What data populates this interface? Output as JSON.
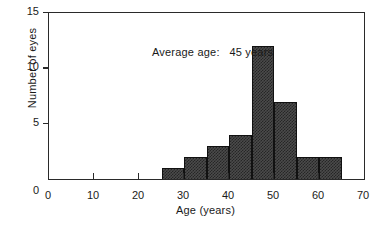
{
  "chart_data": {
    "type": "bar",
    "title": "",
    "subtitle": "",
    "xlabel": "Age (years)",
    "ylabel": "Number of eyes",
    "xlim": [
      0,
      70
    ],
    "ylim": [
      0,
      15
    ],
    "grid": false,
    "legend": null,
    "bin_width": 5,
    "categories": [
      "25-30",
      "30-35",
      "35-40",
      "40-45",
      "45-50",
      "50-55",
      "55-60",
      "60-65"
    ],
    "bin_starts": [
      25,
      30,
      35,
      40,
      45,
      50,
      55,
      60
    ],
    "bin_ends": [
      30,
      35,
      40,
      45,
      50,
      55,
      60,
      65
    ],
    "values": [
      1,
      2,
      3,
      4,
      12,
      7,
      2,
      2
    ],
    "xticks": [
      0,
      10,
      20,
      30,
      40,
      50,
      60,
      70
    ],
    "xtick_labels": [
      "0",
      "10",
      "20",
      "30",
      "40",
      "50",
      "60",
      "70"
    ],
    "yticks": [
      0,
      5,
      10,
      15
    ],
    "ytick_labels": [
      "0",
      "5",
      "10",
      "15"
    ],
    "annotations": [
      {
        "text": "Average age:   45 years",
        "x": 22,
        "y": 13.7
      }
    ],
    "colors": {
      "bar_fill": "#4b4b4b",
      "bar_pattern": "#262626",
      "bar_edge": "#111111",
      "axis": "#2a2a2a",
      "text": "#1a1a1a",
      "background": "#ffffff"
    }
  }
}
